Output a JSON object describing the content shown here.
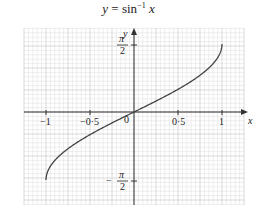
{
  "title": {
    "lhs": "y",
    "eq": " = sin",
    "exp": "−1",
    "var": " x"
  },
  "axes": {
    "x_label": "x",
    "y_label": "y",
    "origin_label": "0",
    "x_ticks": [
      "−1",
      "−0·5",
      "0·5",
      "1"
    ],
    "y_tick_top_num": "π",
    "y_tick_top_den": "2",
    "y_tick_bottom_sign": "−",
    "y_tick_bottom_num": "π",
    "y_tick_bottom_den": "2"
  },
  "colors": {
    "curve": "#444444",
    "axis": "#333333",
    "grid_major": "#c8c8c8",
    "grid_minor": "#e6e6e6"
  },
  "chart_data": {
    "type": "line",
    "xlabel": "x",
    "ylabel": "y",
    "xlim": [
      -1.25,
      1.25
    ],
    "ylim": [
      -1.9,
      1.9
    ],
    "grid": true,
    "x_tick_labels": [
      "−1",
      "−0·5",
      "0",
      "0·5",
      "1"
    ],
    "x_tick_values": [
      -1,
      -0.5,
      0,
      0.5,
      1
    ],
    "y_tick_labels": [
      "−π/2",
      "π/2"
    ],
    "y_tick_values": [
      -1.5708,
      1.5708
    ],
    "series": [
      {
        "name": "y = arcsin(x)",
        "x": [
          -1,
          -0.9,
          -0.75,
          -0.5,
          -0.25,
          0,
          0.25,
          0.5,
          0.75,
          0.9,
          1
        ],
        "y": [
          -1.5708,
          -1.1198,
          -0.8481,
          -0.5236,
          -0.2527,
          0,
          0.2527,
          0.5236,
          0.8481,
          1.1198,
          1.5708
        ]
      }
    ]
  }
}
